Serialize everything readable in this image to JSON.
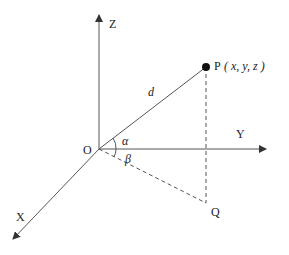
{
  "diagram": {
    "axes": {
      "z_label": "Z",
      "y_label": "Y",
      "x_label": "X",
      "origin_label": "O"
    },
    "points": {
      "p_label": "P",
      "p_coords": "( x, y, z )",
      "q_label": "Q"
    },
    "annotations": {
      "distance": "d",
      "alpha": "α",
      "beta": "β"
    },
    "colors": {
      "line": "#555555",
      "dot": "#111111",
      "text": "#222222"
    }
  }
}
